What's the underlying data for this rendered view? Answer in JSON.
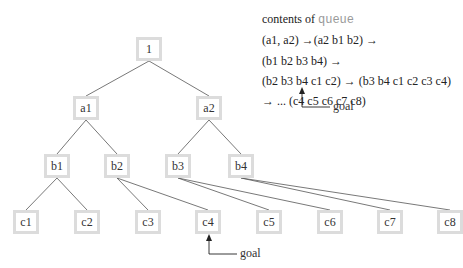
{
  "diagram": {
    "type": "tree",
    "nodes": [
      {
        "id": "1",
        "label": "1",
        "cx": 149,
        "cy": 49
      },
      {
        "id": "a1",
        "label": "a1",
        "cx": 86,
        "cy": 108
      },
      {
        "id": "a2",
        "label": "a2",
        "cx": 209,
        "cy": 108
      },
      {
        "id": "b1",
        "label": "b1",
        "cx": 57,
        "cy": 166
      },
      {
        "id": "b2",
        "label": "b2",
        "cx": 117,
        "cy": 166
      },
      {
        "id": "b3",
        "label": "b3",
        "cx": 178,
        "cy": 166
      },
      {
        "id": "b4",
        "label": "b4",
        "cx": 241,
        "cy": 166
      },
      {
        "id": "c1",
        "label": "c1",
        "cx": 26,
        "cy": 222
      },
      {
        "id": "c2",
        "label": "c2",
        "cx": 87,
        "cy": 222
      },
      {
        "id": "c3",
        "label": "c3",
        "cx": 148,
        "cy": 222
      },
      {
        "id": "c4",
        "label": "c4",
        "cx": 208,
        "cy": 222
      },
      {
        "id": "c5",
        "label": "c5",
        "cx": 269,
        "cy": 222
      },
      {
        "id": "c6",
        "label": "c6",
        "cx": 330,
        "cy": 222
      },
      {
        "id": "c7",
        "label": "c7",
        "cx": 390,
        "cy": 222
      },
      {
        "id": "c8",
        "label": "c8",
        "cx": 450,
        "cy": 222
      }
    ],
    "edges": [
      [
        "1",
        "a1"
      ],
      [
        "1",
        "a2"
      ],
      [
        "a1",
        "b1"
      ],
      [
        "a1",
        "b2"
      ],
      [
        "a2",
        "b3"
      ],
      [
        "a2",
        "b4"
      ],
      [
        "b1",
        "c1"
      ],
      [
        "b1",
        "c2"
      ],
      [
        "b2",
        "c3"
      ],
      [
        "b2",
        "c4"
      ],
      [
        "b3",
        "c5"
      ],
      [
        "b3",
        "c6"
      ],
      [
        "b4",
        "c7"
      ],
      [
        "b4",
        "c8"
      ]
    ],
    "node_border_color": "#dcdcdc",
    "edge_color": "#555555"
  },
  "queue_panel": {
    "heading_prefix": "contents of",
    "heading_code": "queue",
    "lines": [
      "(a1, a2) →(a2 b1 b2) →",
      "(b1 b2 b3 b4) →",
      "(b2 b3 b4 c1 c2) → (b3 b4 c1 c2 c3 c4)",
      "→ ...  (c4 c5 c6 c7 c8)"
    ]
  },
  "annotations": {
    "queue_goal_label": "goal",
    "tree_goal_label": "goal"
  }
}
